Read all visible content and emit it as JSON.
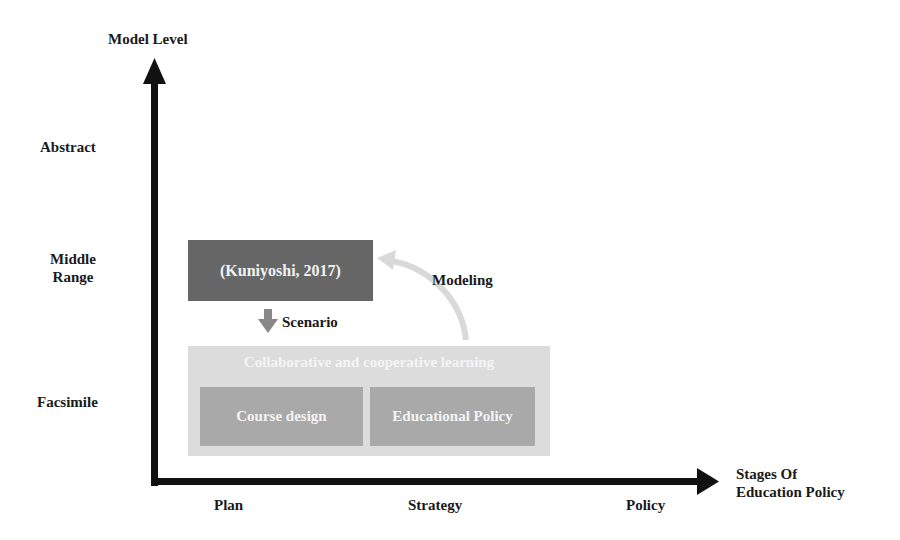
{
  "diagram": {
    "y_axis": {
      "title": "Model Level",
      "levels": [
        "Abstract",
        "Middle Range",
        "Facsimile"
      ],
      "middle_range_lines": [
        "Middle",
        "Range"
      ]
    },
    "x_axis": {
      "title_lines": [
        "Stages Of",
        "Education Policy"
      ],
      "stages": [
        "Plan",
        "Strategy",
        "Policy"
      ]
    },
    "model_box": {
      "label": "(Kuniyoshi, 2017)",
      "color": "#666666"
    },
    "scenario_arrow": {
      "label": "Scenario",
      "color": "#888888"
    },
    "modeling_arrow": {
      "label": "Modeling",
      "color": "#d9d9d9"
    },
    "context_box": {
      "title": "Collaborative and cooperative learning",
      "color": "#dcdcdc",
      "items": [
        {
          "label": "Course design",
          "color": "#a9a9a9"
        },
        {
          "label": "Educational Policy",
          "color": "#a9a9a9"
        }
      ]
    },
    "axis_color": "#111111"
  }
}
